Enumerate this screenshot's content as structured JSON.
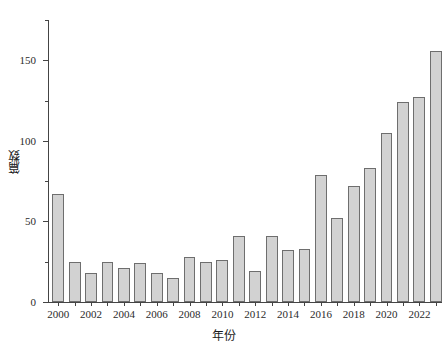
{
  "chart_data": {
    "type": "bar",
    "title": "",
    "xlabel": "年份",
    "ylabel": "篇数",
    "categories": [
      "2000",
      "2001",
      "2002",
      "2003",
      "2004",
      "2005",
      "2006",
      "2007",
      "2008",
      "2009",
      "2010",
      "2011",
      "2012",
      "2013",
      "2014",
      "2015",
      "2016",
      "2017",
      "2018",
      "2019",
      "2020",
      "2021",
      "2022",
      "2023"
    ],
    "values": [
      67,
      25,
      18,
      25,
      21,
      24,
      18,
      15,
      28,
      25,
      26,
      41,
      19,
      41,
      32,
      33,
      79,
      52,
      72,
      83,
      105,
      124,
      127,
      156
    ],
    "ylim": [
      0,
      175
    ],
    "xlim_labels": [
      "2000",
      "2002",
      "2004",
      "2006",
      "2008",
      "2010",
      "2012",
      "2014",
      "2016",
      "2018",
      "2020",
      "2022"
    ],
    "ytick_labels": [
      "0",
      "50",
      "100",
      "150"
    ],
    "ytick_values": [
      0,
      50,
      100,
      150
    ],
    "yminor_values": [
      25,
      75,
      125,
      175
    ],
    "grid": false,
    "legend": null,
    "bar_fill_color": "#d2d2d2",
    "bar_edge_color": "#6e6e6e",
    "axis_color": "#444444"
  }
}
